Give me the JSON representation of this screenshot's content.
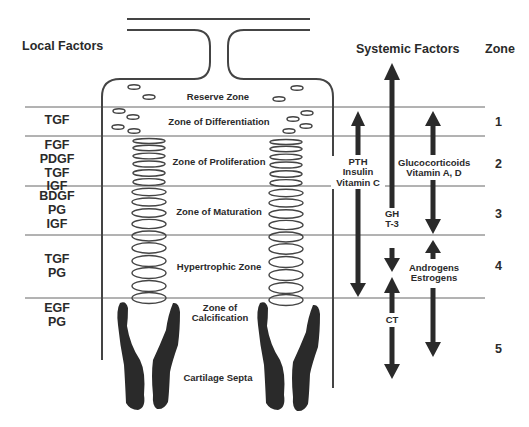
{
  "headers": {
    "local": "Local Factors",
    "systemic": "Systemic Factors",
    "zone": "Zone"
  },
  "zones": [
    {
      "number": "",
      "name": "Reserve Zone",
      "local_factors": ""
    },
    {
      "number": "1",
      "name": "Zone of Differentiation",
      "local_factors": "TGF"
    },
    {
      "number": "2",
      "name": "Zone of Proliferation",
      "local_factors": "FGF\nPDGF\nTGF\nIGF"
    },
    {
      "number": "3",
      "name": "Zone of Maturation",
      "local_factors": "BDGF\nPG\nIGF"
    },
    {
      "number": "4",
      "name": "Hypertrophic Zone",
      "local_factors": "TGF\nPG"
    },
    {
      "number": "5",
      "name": "Zone of\nCalcification",
      "local_factors": "EGF\nPG"
    }
  ],
  "bottom_label": "Cartilage Septa",
  "systemic_factors": {
    "pth": "PTH\nInsulin\nVitamin C",
    "gh": "GH\nT-3",
    "ct": "CT",
    "glucocorticoids": "Glucocorticoids\nVitamin A, D",
    "androgens": "Androgens\nEstrogens"
  },
  "colors": {
    "ink": "#2a2a2a",
    "line": "#555555",
    "background": "#ffffff"
  }
}
